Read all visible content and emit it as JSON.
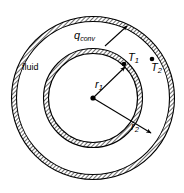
{
  "figure": {
    "name": "annular-pipe-cross-section",
    "width": 184,
    "height": 193,
    "background_color": "#ffffff",
    "line_color": "#000000",
    "hatch_color": "#000000"
  },
  "labels": {
    "fluid": "fluid",
    "q_conv_symbol": "q",
    "q_conv_subscript": "conv",
    "t1_symbol": "T",
    "t1_subscript": "1",
    "t2_symbol": "T",
    "t2_subscript": "2",
    "r1_symbol": "r",
    "r1_subscript": "1",
    "r2_symbol": "r",
    "r2_subscript": "2"
  },
  "geometry": {
    "center_x": 93,
    "center_y": 98,
    "inner_ring_mid_radius": 47,
    "inner_ring_thickness": 5,
    "outer_ring_mid_radius": 79,
    "outer_ring_thickness": 5,
    "center_dot_radius": 2.6
  },
  "annotations": {
    "q_conv_arrow": {
      "from_x": 106,
      "from_y": 45,
      "to_x": 126,
      "to_y": 27,
      "target": "outer-wall-inner-surface"
    },
    "r1_arrow": {
      "from_x": 93,
      "from_y": 98,
      "to_x": 126,
      "to_y": 66,
      "target": "inner-ring"
    },
    "r2_arrow": {
      "from_x": 93,
      "from_y": 98,
      "to_x": 152,
      "to_y": 134,
      "target": "outer-ring"
    },
    "t1_dot": {
      "x": 124,
      "y": 63
    },
    "t2_dot": {
      "x": 152,
      "y": 58
    }
  }
}
